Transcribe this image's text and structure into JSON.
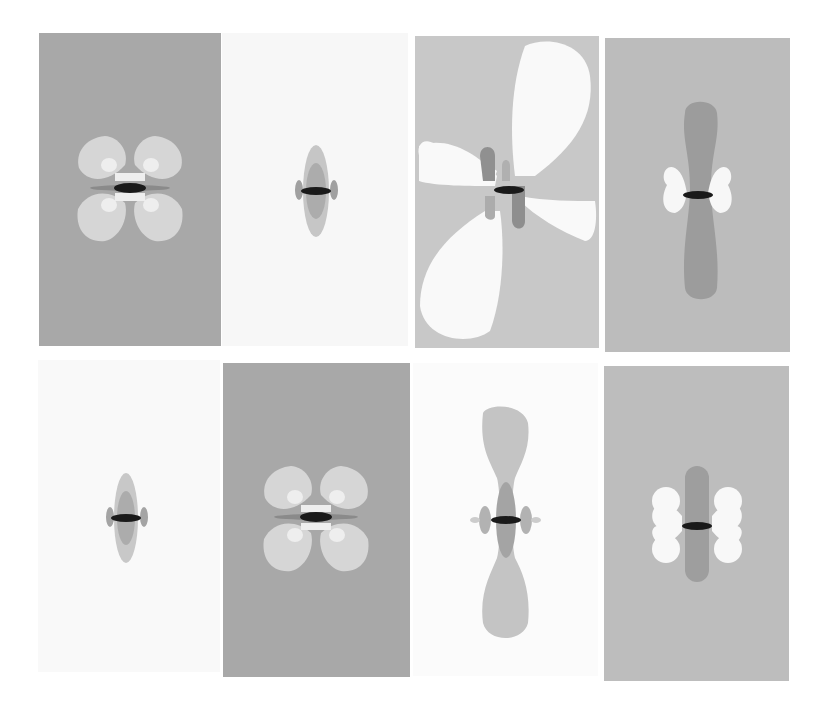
{
  "figure": {
    "layout": {
      "rows": 2,
      "cols": 4
    },
    "panels": [
      {
        "id": 1,
        "row": 1,
        "col": 1,
        "pattern": "four-lobe-x",
        "background": "#a8a8a8",
        "lobe_color": "#d6d6d6",
        "inner_color": "#eeeeee",
        "core_color": "#1a1a1a"
      },
      {
        "id": 2,
        "row": 1,
        "col": 2,
        "pattern": "small-vertical-ellipse",
        "background": "#f7f7f7",
        "lobe_color": "#c6c6c6",
        "inner_color": "#a9a9a9",
        "core_color": "#1a1a1a"
      },
      {
        "id": 3,
        "row": 1,
        "col": 3,
        "pattern": "tilted-quadrupole",
        "background": "#c8c8c8",
        "lobe_color": "#f9f9f9",
        "inner_color": "#909090",
        "core_color": "#1a1a1a"
      },
      {
        "id": 4,
        "row": 1,
        "col": 4,
        "pattern": "vertical-dumbbell-with-white-lobes",
        "background": "#bcbcbc",
        "lobe_color": "#f7f7f7",
        "inner_color": "#9c9c9c",
        "core_color": "#1a1a1a"
      },
      {
        "id": 5,
        "row": 2,
        "col": 1,
        "pattern": "small-vertical-ellipse",
        "background": "#f9f9f9",
        "lobe_color": "#c8c8c8",
        "inner_color": "#acacac",
        "core_color": "#1a1a1a"
      },
      {
        "id": 6,
        "row": 2,
        "col": 2,
        "pattern": "four-lobe-x",
        "background": "#a8a8a8",
        "lobe_color": "#d6d6d6",
        "inner_color": "#eeeeee",
        "core_color": "#1a1a1a"
      },
      {
        "id": 7,
        "row": 2,
        "col": 3,
        "pattern": "vertical-dumbbell",
        "background": "#fbfbfb",
        "lobe_color": "#c4c4c4",
        "inner_color": "#a4a4a4",
        "core_color": "#1a1a1a"
      },
      {
        "id": 8,
        "row": 2,
        "col": 4,
        "pattern": "vertical-bar-with-white-lobes",
        "background": "#bdbdbd",
        "lobe_color": "#f8f8f8",
        "inner_color": "#9e9e9e",
        "core_color": "#1a1a1a"
      }
    ]
  }
}
